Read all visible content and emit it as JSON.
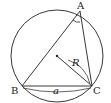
{
  "diagram": {
    "type": "circumscribed-circle-triangle",
    "labels": {
      "A": "A",
      "B": "B",
      "C": "C",
      "radius": "R",
      "side": "a"
    },
    "colors": {
      "stroke": "#222222",
      "background": "#ffffff"
    }
  }
}
